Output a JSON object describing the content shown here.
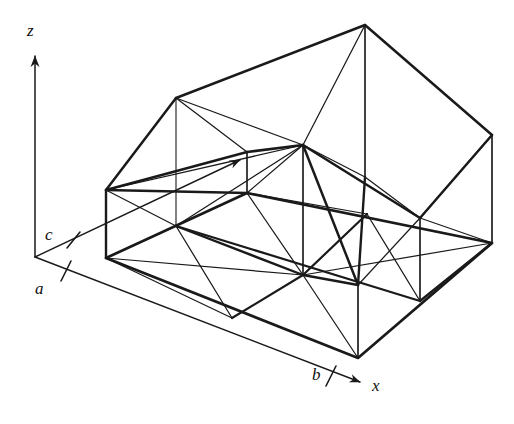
{
  "figure": {
    "background_color": "#ffffff",
    "line_color": "#1a1a1a",
    "axes": {
      "z": {
        "label": "z",
        "arrow": true,
        "origin": [
          35,
          257
        ],
        "tip": [
          35,
          52
        ]
      },
      "x": {
        "label": "x",
        "arrow": true,
        "origin": [
          35,
          257
        ],
        "tip": [
          366,
          385
        ]
      },
      "y": {
        "label": "",
        "arrow": true,
        "origin": [
          35,
          257
        ],
        "tip": [
          247,
          157
        ]
      }
    },
    "ticks": [
      {
        "label": "a",
        "axis": "x",
        "at": [
          66,
          270
        ]
      },
      {
        "label": "b",
        "axis": "x",
        "at": [
          330,
          375
        ]
      },
      {
        "label": "c",
        "axis": "y",
        "at": [
          73,
          240
        ]
      }
    ],
    "geometry": {
      "base_corners": {
        "left": [
          106,
          258
        ],
        "top": [
          247,
          193
        ],
        "right": [
          492,
          243
        ],
        "bottom": [
          358,
          358
        ]
      },
      "base_grid": "2 x 2 quadrilaterals, each split by a diagonal into two triangles",
      "peak": [
        365,
        25
      ],
      "vertical_pillars": 6,
      "surface_nodes": [
        [
          106,
          258
        ],
        [
          247,
          193
        ],
        [
          492,
          243
        ],
        [
          358,
          358
        ],
        [
          176,
          226
        ],
        [
          302,
          276
        ],
        [
          420,
          301
        ],
        [
          303,
          216
        ]
      ]
    },
    "stroke_widths": {
      "base_outline": 2.6,
      "mesh": 1.35,
      "axis": 1.3
    }
  },
  "labels": {
    "z": "z",
    "x": "x",
    "a": "a",
    "b": "b",
    "c": "c"
  }
}
